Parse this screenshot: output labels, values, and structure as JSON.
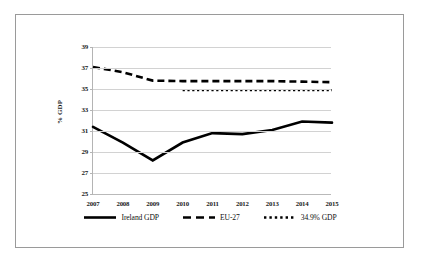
{
  "chart_data": {
    "type": "line",
    "title": "",
    "subtitle": "",
    "xlabel": "",
    "ylabel": "% GDP",
    "categories": [
      "2007",
      "2008",
      "2009",
      "2010",
      "2011",
      "2012",
      "2013",
      "2014",
      "2015"
    ],
    "x": [
      2007,
      2008,
      2009,
      2010,
      2011,
      2012,
      2013,
      2014,
      2015
    ],
    "ylim": [
      25,
      39
    ],
    "xlim": [
      2007,
      2015
    ],
    "yticks": [
      "39",
      "37",
      "35",
      "33",
      "31",
      "29",
      "27",
      "25"
    ],
    "ytick_values": [
      39,
      37,
      35,
      33,
      31,
      29,
      27,
      25
    ],
    "ytick_step": 2,
    "grid": "horizontal",
    "legend_position": "bottom-center",
    "series": [
      {
        "name": "Ireland GDP",
        "style": "solid",
        "color": "#000000",
        "width": 2.6,
        "values": [
          31.4,
          29.9,
          28.2,
          29.9,
          30.8,
          30.7,
          31.1,
          31.9,
          31.8
        ]
      },
      {
        "name": "EU-27",
        "style": "dashed",
        "color": "#000000",
        "width": 2.6,
        "values": [
          37.1,
          36.6,
          35.8,
          35.75,
          35.75,
          35.75,
          35.75,
          35.7,
          35.65
        ]
      },
      {
        "name": "34.9% GDP",
        "style": "dotted",
        "color": "#000000",
        "width": 2.2,
        "start_category": "2010",
        "values": [
          null,
          null,
          null,
          34.9,
          34.9,
          34.9,
          34.9,
          34.9,
          34.9
        ]
      }
    ],
    "legend": [
      {
        "label": "Ireland GDP",
        "style": "solid",
        "marker": "solid-line-marker"
      },
      {
        "label": "EU-27",
        "style": "dashed",
        "marker": "dashed-line-marker"
      },
      {
        "label": "34.9% GDP",
        "style": "dotted",
        "marker": "dotted-line-marker"
      }
    ],
    "colors": {
      "series": "#000000",
      "gridline": "#d2d2d2",
      "axis": "#b4b4b4",
      "frame": "#9a9a9a",
      "background": "#ffffff",
      "text": "#1a1a1a"
    }
  }
}
